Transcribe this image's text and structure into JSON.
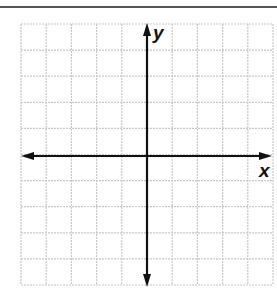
{
  "diagram": {
    "type": "coordinate-plane",
    "grid": {
      "columns": 10,
      "rows": 10,
      "line_color": "#c8c8c8"
    },
    "axes": {
      "color": "#111111",
      "x_label": "x",
      "y_label": "y",
      "origin_column": 5,
      "origin_row": 5
    }
  },
  "chart_data": {
    "type": "scatter",
    "title": "",
    "xlabel": "x",
    "ylabel": "y",
    "xlim": [
      -5,
      5
    ],
    "ylim": [
      -5,
      5
    ],
    "grid": true,
    "series": []
  }
}
